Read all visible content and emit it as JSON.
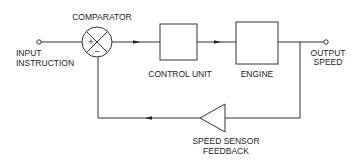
{
  "diagram": {
    "colors": {
      "line": "#333333",
      "text": "#222222",
      "background": "#ffffff"
    },
    "nodes": {
      "input": {
        "label_line1": "INPUT",
        "label_line2": "INSTRUCTION"
      },
      "comparator": {
        "label": "COMPARATOR",
        "plus": "+",
        "minus": "−"
      },
      "control_unit": {
        "label": "CONTROL UNIT"
      },
      "engine": {
        "label": "ENGINE"
      },
      "output": {
        "label_line1": "OUTPUT",
        "label_line2": "SPEED"
      },
      "sensor": {
        "label_line1": "SPEED SENSOR",
        "label_line2": "FEEDBACK"
      }
    },
    "edges": [
      {
        "from": "input",
        "to": "comparator"
      },
      {
        "from": "comparator",
        "to": "control_unit"
      },
      {
        "from": "control_unit",
        "to": "engine"
      },
      {
        "from": "engine",
        "to": "output"
      },
      {
        "from": "output",
        "to": "sensor"
      },
      {
        "from": "sensor",
        "to": "comparator"
      }
    ]
  }
}
